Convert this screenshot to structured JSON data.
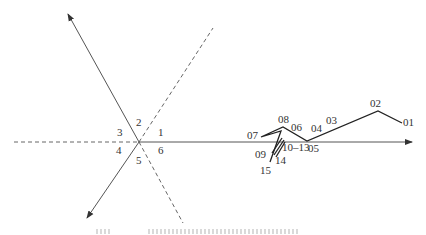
{
  "diagram": {
    "center_point": {
      "x": 139,
      "y": 142
    },
    "sector_labels": [
      {
        "text": "1",
        "x": 158,
        "y": 136
      },
      {
        "text": "2",
        "x": 136,
        "y": 126
      },
      {
        "text": "3",
        "x": 117,
        "y": 136
      },
      {
        "text": "4",
        "x": 116,
        "y": 154
      },
      {
        "text": "5",
        "x": 136,
        "y": 164
      },
      {
        "text": "6",
        "x": 158,
        "y": 154
      }
    ],
    "solid_axes": [
      {
        "name": "axis-horizontal-right",
        "from": [
          139,
          142
        ],
        "to": [
          412,
          142
        ],
        "arrow": true
      },
      {
        "name": "axis-upper-left",
        "from": [
          139,
          142
        ],
        "to": [
          68,
          14
        ],
        "arrow": true
      },
      {
        "name": "axis-lower-left",
        "from": [
          139,
          142
        ],
        "to": [
          87,
          218
        ],
        "arrow": true
      }
    ],
    "dashed_axes": [
      {
        "name": "dashed-horizontal-left",
        "from": [
          14,
          142
        ],
        "to": [
          139,
          142
        ]
      },
      {
        "name": "dashed-upper-right",
        "from": [
          139,
          142
        ],
        "to": [
          213,
          28
        ]
      },
      {
        "name": "dashed-lower-right",
        "from": [
          139,
          142
        ],
        "to": [
          183,
          223
        ]
      }
    ],
    "track_points": [
      {
        "id": "01",
        "x": 402,
        "y": 123,
        "label_x": 403,
        "label_y": 126
      },
      {
        "id": "02",
        "x": 378,
        "y": 111,
        "label_x": 370,
        "label_y": 107
      },
      {
        "id": "03",
        "x": 345,
        "y": 125,
        "label_x": 326,
        "label_y": 124
      },
      {
        "id": "04",
        "x": 325,
        "y": 134,
        "label_x": 311,
        "label_y": 132
      },
      {
        "id": "05",
        "x": 307,
        "y": 141,
        "label_x": 308,
        "label_y": 152
      },
      {
        "id": "06",
        "x": 290,
        "y": 133,
        "label_x": 291,
        "label_y": 131
      },
      {
        "id": "07",
        "x": 261,
        "y": 137,
        "label_x": 247,
        "label_y": 139
      },
      {
        "id": "08",
        "x": 283,
        "y": 127,
        "label_x": 278,
        "label_y": 123
      },
      {
        "id": "09",
        "x": 272,
        "y": 151,
        "label_x": 255,
        "label_y": 158
      },
      {
        "id": "10–13",
        "x": 280,
        "y": 141,
        "label_x": 282,
        "label_y": 151
      },
      {
        "id": "14",
        "x": 273,
        "y": 156,
        "label_x": 275,
        "label_y": 164
      },
      {
        "id": "15",
        "x": 270,
        "y": 162,
        "label_x": 260,
        "label_y": 174
      }
    ],
    "track_path": "M402,123 L378,111 L307,141 L283,127 L261,137 L281,131 L270,162",
    "track_hatch": [
      "M272,153 L282,138",
      "M274,155 L284,140",
      "M276,157 L285,142"
    ]
  },
  "caption": {
    "visible": "truncated (only top edge of caption text visible at bottom)"
  },
  "colors": {
    "axis": "#555555",
    "track": "#222222",
    "label": "#333333",
    "background": "#ffffff"
  }
}
